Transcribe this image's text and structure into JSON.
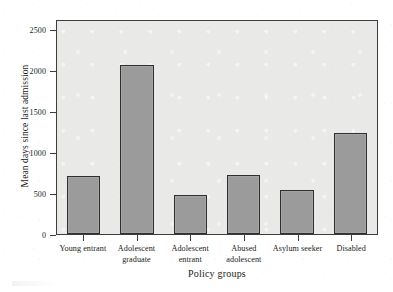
{
  "chart_data": {
    "type": "bar",
    "title": "",
    "xlabel": "Policy groups",
    "ylabel": "Mean days since last admission",
    "categories": [
      "Young entrant",
      "Adolescent graduate",
      "Adolescent entrant",
      "Abused adolescent",
      "Asylum seeker",
      "Disabled"
    ],
    "category_lines": [
      [
        "Young entrant"
      ],
      [
        "Adolescent",
        "graduate"
      ],
      [
        "Adolescent",
        "entrant"
      ],
      [
        "Abused",
        "adolescent"
      ],
      [
        "Asylum seeker"
      ],
      [
        "Disabled"
      ]
    ],
    "values": [
      710,
      2060,
      480,
      725,
      540,
      1225
    ],
    "ylim": [
      0,
      2620
    ],
    "yticks": [
      0,
      500,
      1000,
      1500,
      2000,
      2500
    ],
    "ytick_labels": [
      "0",
      "500",
      "1000",
      "1500",
      "2000",
      "2500"
    ],
    "grid": false,
    "legend": null,
    "bar_color": "#9b9b9b",
    "bar_edge_color": "#2f2f2f",
    "plot_background": "#e9e9e7",
    "axis_color": "#3d3d3d"
  }
}
